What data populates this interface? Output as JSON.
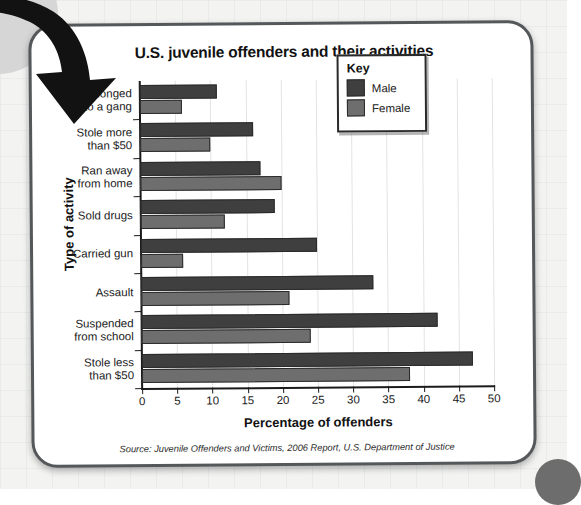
{
  "chart_data": {
    "type": "bar",
    "orientation": "horizontal",
    "title": "U.S. juvenile offenders and their activities",
    "xlabel": "Percentage of offenders",
    "ylabel": "Type of activity",
    "xlim": [
      0,
      50
    ],
    "xticks": [
      0,
      5,
      10,
      15,
      20,
      25,
      30,
      35,
      40,
      45,
      50
    ],
    "grid": true,
    "legend_position": "upper right",
    "legend_title": "Key",
    "categories": [
      "Belonged to a gang",
      "Stole more than $50",
      "Ran away from home",
      "Sold drugs",
      "Carried gun",
      "Assault",
      "Suspended from school",
      "Stole less than $50"
    ],
    "category_lines": [
      [
        "Belonged",
        "to a gang"
      ],
      [
        "Stole more",
        "than $50"
      ],
      [
        "Ran away",
        "from home"
      ],
      [
        "Sold drugs"
      ],
      [
        "Carried gun"
      ],
      [
        "Assault"
      ],
      [
        "Suspended",
        "from school"
      ],
      [
        "Stole less",
        "than $50"
      ]
    ],
    "series": [
      {
        "name": "Male",
        "color": "#3f3f3f",
        "values": [
          11,
          16,
          17,
          19,
          25,
          33,
          42,
          47
        ]
      },
      {
        "name": "Female",
        "color": "#6e6e6e",
        "values": [
          6,
          10,
          20,
          12,
          6,
          21,
          24,
          38
        ]
      }
    ],
    "source": "Source: Juvenile Offenders and Victims, 2006 Report, U.S. Department of Justice"
  },
  "overlay": {
    "arrow_icon": "curved-down-right-arrow"
  }
}
